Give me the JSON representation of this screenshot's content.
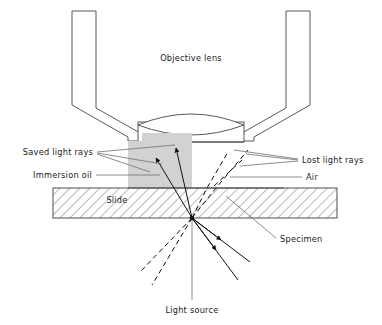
{
  "figure": {
    "title_label": "Objective lens",
    "labels": {
      "objective_lens": "Objective lens",
      "saved_light_rays": "Saved light rays",
      "lost_light_rays": "Lost light rays",
      "immersion_oil": "Immersion oil",
      "air": "Air",
      "slide": "Slide",
      "specimen": "Specimen",
      "light_source": "Light source"
    },
    "colors": {
      "outline": "#555a5f",
      "oil_fill": "#d2d2d2",
      "ray": "#111111",
      "leader": "#6e6e6e",
      "text": "#1a1a1a",
      "background": "#ffffff"
    },
    "geometry": {
      "specimen_point": "192,218",
      "slide_left": "53",
      "slide_right": "337",
      "slide_top": "188",
      "slide_bottom": "218",
      "oil_left": "128",
      "oil_right": "192",
      "oil_top": "133",
      "oil_bottom": "188"
    }
  }
}
